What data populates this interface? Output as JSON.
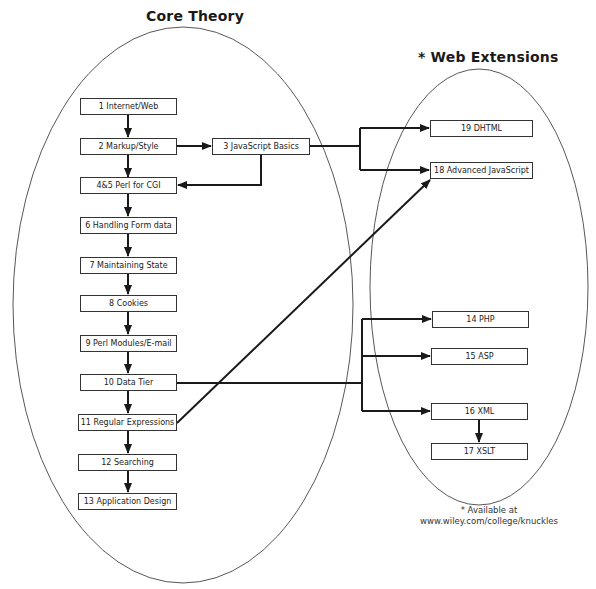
{
  "titles": {
    "core": "Core Theory",
    "web": "* Web Extensions"
  },
  "core_chapters": [
    {
      "id": "1",
      "label": "1 Internet/Web"
    },
    {
      "id": "2",
      "label": "2 Markup/Style"
    },
    {
      "id": "4-5",
      "label": "4&5 Perl for CGI"
    },
    {
      "id": "6",
      "label": "6  Handling Form data"
    },
    {
      "id": "7",
      "label": "7 Maintaining State"
    },
    {
      "id": "8",
      "label": "8 Cookies"
    },
    {
      "id": "9",
      "label": "9 Perl Modules/E-mail"
    },
    {
      "id": "10",
      "label": "10 Data Tier"
    },
    {
      "id": "11",
      "label": "11 Regular Expressions"
    },
    {
      "id": "12",
      "label": "12 Searching"
    },
    {
      "id": "13",
      "label": "13 Application Design"
    }
  ],
  "side_chapter": {
    "id": "3",
    "label": "3 JavaScript Basics"
  },
  "web_chapters": [
    {
      "id": "19",
      "label": "19 DHTML"
    },
    {
      "id": "18",
      "label": "18 Advanced JavaScript"
    },
    {
      "id": "14",
      "label": "14 PHP"
    },
    {
      "id": "15",
      "label": "15 ASP"
    },
    {
      "id": "16",
      "label": "16 XML"
    },
    {
      "id": "17",
      "label": "17 XSLT"
    }
  ],
  "edges": [
    [
      "1",
      "2"
    ],
    [
      "2",
      "3"
    ],
    [
      "2",
      "4-5"
    ],
    [
      "3",
      "4-5"
    ],
    [
      "3",
      "19"
    ],
    [
      "3",
      "18"
    ],
    [
      "4-5",
      "6"
    ],
    [
      "6",
      "7"
    ],
    [
      "7",
      "8"
    ],
    [
      "8",
      "9"
    ],
    [
      "9",
      "10"
    ],
    [
      "10",
      "11"
    ],
    [
      "11",
      "12"
    ],
    [
      "12",
      "13"
    ],
    [
      "11",
      "18"
    ],
    [
      "10",
      "14"
    ],
    [
      "10",
      "15"
    ],
    [
      "10",
      "16"
    ],
    [
      "16",
      "17"
    ]
  ],
  "footnote": {
    "line1": "* Available at",
    "line2": "www.wiley.com/college/knuckles"
  },
  "colors": {
    "line": "#1a1a1a",
    "ellipse": "#444444",
    "background": "#ffffff"
  }
}
